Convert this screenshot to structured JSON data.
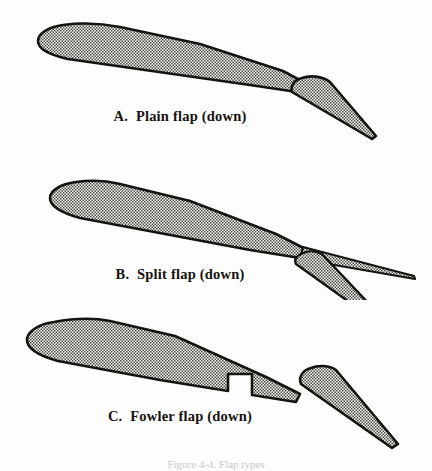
{
  "figure": {
    "background_color": "#fdfdfd",
    "ink_color": "#15130f",
    "fill_texture": "diagonal-crosshatch-stipple",
    "caption_clipped": "Figure 4-4.  Flap types"
  },
  "panels": [
    {
      "id": "a",
      "letter": "A.",
      "label": "Plain flap (down)",
      "flap_type": "plain",
      "description": "Entire rear portion of the airfoil hinges downward as one solid piece",
      "airfoil_span_px": [
        38,
        305
      ],
      "flap_tip_px": [
        375,
        138
      ]
    },
    {
      "id": "b",
      "letter": "B.",
      "label": "Split flap (down)",
      "flap_type": "split",
      "description": "Lower surface panel deflects downward while the upper surface remains fixed, forming two prongs",
      "airfoil_span_px": [
        50,
        305
      ],
      "flap_tip_px": [
        415,
        270
      ]
    },
    {
      "id": "c",
      "letter": "C.",
      "label": "Fowler flap (down)",
      "flap_type": "fowler",
      "description": "Flap segment translates aft and downward, leaving a slot gap and a recess in the lower surface",
      "airfoil_span_px": [
        27,
        300
      ],
      "flap_tip_px": [
        400,
        440
      ]
    }
  ]
}
